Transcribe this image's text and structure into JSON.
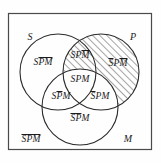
{
  "figure": {
    "type": "venn-diagram-three-set",
    "frame": {
      "visible": true,
      "color": "#4a4a4a"
    },
    "sets": [
      {
        "name": "S",
        "label": "S",
        "position": "top-left"
      },
      {
        "name": "P",
        "label": "P",
        "position": "top-right"
      },
      {
        "name": "M",
        "label": "M",
        "position": "bottom-right"
      }
    ],
    "shading": {
      "style": "diagonal-hatch",
      "color": "#3a3a3a",
      "region": "P-minus-M",
      "description": "All parts of circle P that lie outside circle M are hatched"
    },
    "regions": [
      {
        "id": "S-only",
        "bar_over": "PM",
        "parts": [
          {
            "text": "S",
            "bar": false
          },
          {
            "text": "PM",
            "bar": true
          }
        ],
        "hatched": false
      },
      {
        "id": "S-and-P-not-M",
        "bar_over": "M",
        "parts": [
          {
            "text": "SP",
            "bar": false
          },
          {
            "text": "M",
            "bar": true
          }
        ],
        "hatched": true
      },
      {
        "id": "P-only",
        "bar_over": "SM",
        "parts": [
          {
            "text": "S",
            "bar": true
          },
          {
            "text": "P",
            "bar": false
          },
          {
            "text": "M",
            "bar": true
          }
        ],
        "hatched": true
      },
      {
        "id": "S-and-P-and-M",
        "bar_over": "",
        "parts": [
          {
            "text": "SPM",
            "bar": false
          }
        ],
        "hatched": false
      },
      {
        "id": "S-and-M-not-P",
        "bar_over": "P",
        "parts": [
          {
            "text": "S",
            "bar": false
          },
          {
            "text": "P",
            "bar": true
          },
          {
            "text": "M",
            "bar": false
          }
        ],
        "hatched": false
      },
      {
        "id": "P-and-M-not-S",
        "bar_over": "S",
        "parts": [
          {
            "text": "S",
            "bar": true
          },
          {
            "text": "PM",
            "bar": false
          }
        ],
        "hatched": false
      },
      {
        "id": "M-only",
        "bar_over": "SP",
        "parts": [
          {
            "text": "SP",
            "bar": true
          },
          {
            "text": "M",
            "bar": false
          }
        ],
        "hatched": false
      },
      {
        "id": "outside-all",
        "bar_over": "SPM",
        "parts": [
          {
            "text": "SPM",
            "bar": true
          }
        ],
        "hatched": false
      }
    ],
    "labels": {
      "s_set": "S",
      "p_set": "P",
      "m_set": "M",
      "s_only": "SPM",
      "sp_not_m": "SPM",
      "p_only": "SPM",
      "spm": "SPM",
      "sm_not_p": "SPM",
      "pm_not_s": "SPM",
      "m_only": "SPM",
      "outside": "SPM"
    }
  }
}
